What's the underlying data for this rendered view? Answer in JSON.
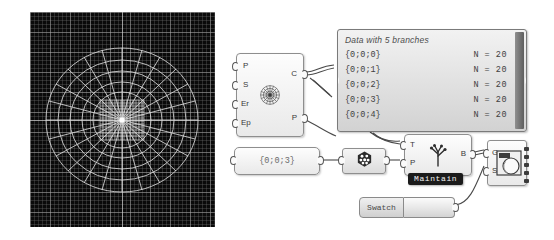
{
  "viewport": {
    "name": "rhino-perspective-viewport",
    "background_color": "#0a0a0a",
    "mesh_color": "#d8d8d8",
    "grid_color": "#787878",
    "description": "Polar radial surface mesh with dense square grid patch at center"
  },
  "nodes": {
    "polar_component": {
      "inputs": [
        "P",
        "S",
        "Er",
        "Ep"
      ],
      "outputs": [
        "C",
        "P"
      ],
      "icon": "radial-burst-icon"
    },
    "data_panel": {
      "title": "Data with 5 branches",
      "rows": [
        {
          "path": "{0;0;0}",
          "count": "N = 20"
        },
        {
          "path": "{0;0;1}",
          "count": "N = 20"
        },
        {
          "path": "{0;0;2}",
          "count": "N = 20"
        },
        {
          "path": "{0;0;3}",
          "count": "N = 20"
        },
        {
          "path": "{0;0;4}",
          "count": "N = 20"
        }
      ]
    },
    "path_param": {
      "value": "{0;0;3}"
    },
    "explode_component": {
      "icon": "grasshopper-tree-icon"
    },
    "tree_branch_component": {
      "inputs": [
        "T",
        "P"
      ],
      "outputs": [
        "B"
      ],
      "tag": "Maintain",
      "icon": "tree-branch-icon"
    },
    "preview_component": {
      "inputs": [
        "G",
        "S"
      ],
      "icon": "custom-preview-icon",
      "output_nub_count": 5
    },
    "swatch": {
      "label": "Swatch"
    }
  },
  "colors": {
    "page_background": "#ffffff",
    "node_fill": "#f4f4f4",
    "node_border": "#8e8e8e",
    "panel_fill": "#d2d2d2",
    "tag_background": "#1b1b1b",
    "wire_color": "#4a4a4a"
  }
}
